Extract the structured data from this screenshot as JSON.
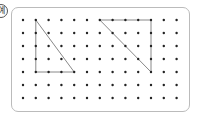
{
  "label": "예",
  "grid": {
    "columns": 13,
    "rows": 7,
    "origin_x": 23,
    "origin_y": 20,
    "spacing_x": 12.8,
    "spacing_y": 13,
    "dot_color": "#222222",
    "line_color": "#888888"
  },
  "shapes": [
    {
      "name": "left-triangle",
      "points": [
        [
          1,
          0
        ],
        [
          1,
          4
        ],
        [
          4,
          4
        ]
      ]
    },
    {
      "name": "right-triangle",
      "points": [
        [
          6,
          0
        ],
        [
          10,
          0
        ],
        [
          10,
          4
        ]
      ]
    }
  ]
}
